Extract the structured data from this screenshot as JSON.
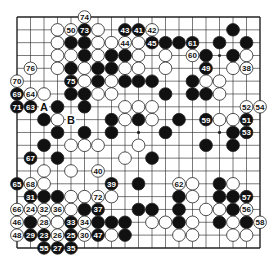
{
  "diagram": {
    "type": "go-board",
    "size": 19,
    "grid": {
      "x0": 17,
      "y0": 17,
      "dx": 13.5,
      "dy": 12.83
    },
    "colors": {
      "line": "#222222",
      "black_stone": "#111111",
      "white_stone": "#ffffff",
      "stone_outline": "#222222",
      "background": "#ffffff"
    },
    "star_points": [
      [
        3,
        3
      ],
      [
        3,
        9
      ],
      [
        3,
        15
      ],
      [
        9,
        3
      ],
      [
        9,
        9
      ],
      [
        9,
        15
      ],
      [
        15,
        3
      ],
      [
        15,
        9
      ],
      [
        15,
        15
      ]
    ],
    "stones": [
      {
        "r": 0,
        "c": 5,
        "color": "W",
        "label": "74"
      },
      {
        "r": 1,
        "c": 3,
        "color": "W"
      },
      {
        "r": 1,
        "c": 4,
        "color": "W",
        "label": "50"
      },
      {
        "r": 1,
        "c": 5,
        "color": "B",
        "label": "73"
      },
      {
        "r": 1,
        "c": 6,
        "color": "W"
      },
      {
        "r": 1,
        "c": 8,
        "color": "B",
        "label": "43"
      },
      {
        "r": 1,
        "c": 9,
        "color": "B",
        "label": "41"
      },
      {
        "r": 1,
        "c": 10,
        "color": "W",
        "label": "42"
      },
      {
        "r": 1,
        "c": 16,
        "color": "B"
      },
      {
        "r": 2,
        "c": 3,
        "color": "W"
      },
      {
        "r": 2,
        "c": 4,
        "color": "B"
      },
      {
        "r": 2,
        "c": 5,
        "color": "B"
      },
      {
        "r": 2,
        "c": 6,
        "color": "W"
      },
      {
        "r": 2,
        "c": 7,
        "color": "W"
      },
      {
        "r": 2,
        "c": 8,
        "color": "W",
        "label": "44"
      },
      {
        "r": 2,
        "c": 9,
        "color": "W"
      },
      {
        "r": 2,
        "c": 10,
        "color": "B",
        "label": "45"
      },
      {
        "r": 2,
        "c": 11,
        "color": "B"
      },
      {
        "r": 2,
        "c": 12,
        "color": "B"
      },
      {
        "r": 2,
        "c": 13,
        "color": "B",
        "label": "61"
      },
      {
        "r": 2,
        "c": 15,
        "color": "B"
      },
      {
        "r": 2,
        "c": 17,
        "color": "B"
      },
      {
        "r": 3,
        "c": 3,
        "color": "W"
      },
      {
        "r": 3,
        "c": 4,
        "color": "W"
      },
      {
        "r": 3,
        "c": 5,
        "color": "B"
      },
      {
        "r": 3,
        "c": 6,
        "color": "W"
      },
      {
        "r": 3,
        "c": 7,
        "color": "B"
      },
      {
        "r": 3,
        "c": 8,
        "color": "B"
      },
      {
        "r": 3,
        "c": 9,
        "color": "W"
      },
      {
        "r": 3,
        "c": 11,
        "color": "W"
      },
      {
        "r": 3,
        "c": 13,
        "color": "W",
        "label": "60"
      },
      {
        "r": 3,
        "c": 14,
        "color": "B"
      },
      {
        "r": 3,
        "c": 16,
        "color": "B"
      },
      {
        "r": 3,
        "c": 17,
        "color": "W"
      },
      {
        "r": 4,
        "c": 1,
        "color": "W",
        "label": "76"
      },
      {
        "r": 4,
        "c": 3,
        "color": "W"
      },
      {
        "r": 4,
        "c": 4,
        "color": "B"
      },
      {
        "r": 4,
        "c": 5,
        "color": "W"
      },
      {
        "r": 4,
        "c": 6,
        "color": "B"
      },
      {
        "r": 4,
        "c": 7,
        "color": "B"
      },
      {
        "r": 4,
        "c": 8,
        "color": "W"
      },
      {
        "r": 4,
        "c": 9,
        "color": "W"
      },
      {
        "r": 4,
        "c": 11,
        "color": "W"
      },
      {
        "r": 4,
        "c": 14,
        "color": "B",
        "label": "49"
      },
      {
        "r": 4,
        "c": 16,
        "color": "W"
      },
      {
        "r": 4,
        "c": 17,
        "color": "W",
        "label": "38"
      },
      {
        "r": 5,
        "c": 0,
        "color": "W",
        "label": "70"
      },
      {
        "r": 5,
        "c": 4,
        "color": "B",
        "label": "75"
      },
      {
        "r": 5,
        "c": 5,
        "color": "W"
      },
      {
        "r": 5,
        "c": 6,
        "color": "B"
      },
      {
        "r": 5,
        "c": 7,
        "color": "W"
      },
      {
        "r": 5,
        "c": 8,
        "color": "B"
      },
      {
        "r": 5,
        "c": 9,
        "color": "B"
      },
      {
        "r": 5,
        "c": 10,
        "color": "B"
      },
      {
        "r": 5,
        "c": 13,
        "color": "B"
      },
      {
        "r": 5,
        "c": 14,
        "color": "W"
      },
      {
        "r": 5,
        "c": 15,
        "color": "W"
      },
      {
        "r": 6,
        "c": 0,
        "color": "B",
        "label": "69"
      },
      {
        "r": 6,
        "c": 1,
        "color": "W",
        "label": "64"
      },
      {
        "r": 6,
        "c": 2,
        "color": "W"
      },
      {
        "r": 6,
        "c": 4,
        "color": "B"
      },
      {
        "r": 6,
        "c": 5,
        "color": "B"
      },
      {
        "r": 6,
        "c": 6,
        "color": "W"
      },
      {
        "r": 6,
        "c": 7,
        "color": "W"
      },
      {
        "r": 6,
        "c": 11,
        "color": "B"
      },
      {
        "r": 6,
        "c": 13,
        "color": "B"
      },
      {
        "r": 6,
        "c": 14,
        "color": "B"
      },
      {
        "r": 6,
        "c": 15,
        "color": "W"
      },
      {
        "r": 7,
        "c": 0,
        "color": "B",
        "label": "71"
      },
      {
        "r": 7,
        "c": 1,
        "color": "B",
        "label": "63"
      },
      {
        "r": 7,
        "c": 3,
        "color": "B"
      },
      {
        "r": 7,
        "c": 5,
        "color": "B"
      },
      {
        "r": 7,
        "c": 8,
        "color": "W"
      },
      {
        "r": 7,
        "c": 9,
        "color": "W"
      },
      {
        "r": 7,
        "c": 10,
        "color": "W"
      },
      {
        "r": 7,
        "c": 17,
        "color": "W",
        "label": "52"
      },
      {
        "r": 7,
        "c": 18,
        "color": "W",
        "label": "54"
      },
      {
        "r": 8,
        "c": 2,
        "color": "B"
      },
      {
        "r": 8,
        "c": 3,
        "color": "W"
      },
      {
        "r": 8,
        "c": 7,
        "color": "B"
      },
      {
        "r": 8,
        "c": 8,
        "color": "W"
      },
      {
        "r": 8,
        "c": 9,
        "color": "B"
      },
      {
        "r": 8,
        "c": 10,
        "color": "W"
      },
      {
        "r": 8,
        "c": 12,
        "color": "B"
      },
      {
        "r": 8,
        "c": 14,
        "color": "B",
        "label": "59"
      },
      {
        "r": 8,
        "c": 15,
        "color": "W"
      },
      {
        "r": 8,
        "c": 16,
        "color": "W"
      },
      {
        "r": 8,
        "c": 17,
        "color": "B",
        "label": "51"
      },
      {
        "r": 9,
        "c": 3,
        "color": "B"
      },
      {
        "r": 9,
        "c": 5,
        "color": "B"
      },
      {
        "r": 9,
        "c": 7,
        "color": "B"
      },
      {
        "r": 9,
        "c": 11,
        "color": "B"
      },
      {
        "r": 9,
        "c": 16,
        "color": "B"
      },
      {
        "r": 9,
        "c": 17,
        "color": "B",
        "label": "53"
      },
      {
        "r": 10,
        "c": 2,
        "color": "B"
      },
      {
        "r": 10,
        "c": 4,
        "color": "W"
      },
      {
        "r": 10,
        "c": 5,
        "color": "W"
      },
      {
        "r": 10,
        "c": 6,
        "color": "W"
      },
      {
        "r": 10,
        "c": 9,
        "color": "W"
      },
      {
        "r": 10,
        "c": 14,
        "color": "B"
      },
      {
        "r": 10,
        "c": 16,
        "color": "B"
      },
      {
        "r": 11,
        "c": 1,
        "color": "B",
        "label": "67"
      },
      {
        "r": 11,
        "c": 3,
        "color": "B"
      },
      {
        "r": 11,
        "c": 8,
        "color": "W"
      },
      {
        "r": 11,
        "c": 10,
        "color": "B"
      },
      {
        "r": 12,
        "c": 2,
        "color": "W"
      },
      {
        "r": 12,
        "c": 4,
        "color": "W"
      },
      {
        "r": 12,
        "c": 6,
        "color": "W",
        "label": "40"
      },
      {
        "r": 13,
        "c": 0,
        "color": "B",
        "label": "65"
      },
      {
        "r": 13,
        "c": 1,
        "color": "W",
        "label": "68"
      },
      {
        "r": 13,
        "c": 2,
        "color": "W"
      },
      {
        "r": 13,
        "c": 7,
        "color": "B",
        "label": "39"
      },
      {
        "r": 13,
        "c": 9,
        "color": "B"
      },
      {
        "r": 13,
        "c": 12,
        "color": "W",
        "label": "62"
      },
      {
        "r": 13,
        "c": 13,
        "color": "W"
      },
      {
        "r": 13,
        "c": 15,
        "color": "B"
      },
      {
        "r": 13,
        "c": 16,
        "color": "W"
      },
      {
        "r": 14,
        "c": 1,
        "color": "B",
        "label": "31"
      },
      {
        "r": 14,
        "c": 2,
        "color": "B"
      },
      {
        "r": 14,
        "c": 3,
        "color": "B"
      },
      {
        "r": 14,
        "c": 4,
        "color": "W"
      },
      {
        "r": 14,
        "c": 5,
        "color": "W"
      },
      {
        "r": 14,
        "c": 6,
        "color": "W",
        "label": "72"
      },
      {
        "r": 14,
        "c": 7,
        "color": "W"
      },
      {
        "r": 14,
        "c": 12,
        "color": "B"
      },
      {
        "r": 14,
        "c": 13,
        "color": "W"
      },
      {
        "r": 14,
        "c": 15,
        "color": "B"
      },
      {
        "r": 14,
        "c": 16,
        "color": "B"
      },
      {
        "r": 14,
        "c": 17,
        "color": "B",
        "label": "57"
      },
      {
        "r": 15,
        "c": 0,
        "color": "W",
        "label": "66"
      },
      {
        "r": 15,
        "c": 1,
        "color": "W",
        "label": "24"
      },
      {
        "r": 15,
        "c": 2,
        "color": "W",
        "label": "32"
      },
      {
        "r": 15,
        "c": 3,
        "color": "W",
        "label": "36"
      },
      {
        "r": 15,
        "c": 4,
        "color": "W"
      },
      {
        "r": 15,
        "c": 5,
        "color": "B"
      },
      {
        "r": 15,
        "c": 6,
        "color": "B",
        "label": "37"
      },
      {
        "r": 15,
        "c": 9,
        "color": "B"
      },
      {
        "r": 15,
        "c": 10,
        "color": "B"
      },
      {
        "r": 15,
        "c": 12,
        "color": "B"
      },
      {
        "r": 15,
        "c": 14,
        "color": "W"
      },
      {
        "r": 15,
        "c": 15,
        "color": "W"
      },
      {
        "r": 15,
        "c": 16,
        "color": "B"
      },
      {
        "r": 15,
        "c": 17,
        "color": "W",
        "label": "56"
      },
      {
        "r": 16,
        "c": 0,
        "color": "W",
        "label": "46"
      },
      {
        "r": 16,
        "c": 1,
        "color": "B"
      },
      {
        "r": 16,
        "c": 2,
        "color": "W",
        "label": "28"
      },
      {
        "r": 16,
        "c": 3,
        "color": "W"
      },
      {
        "r": 16,
        "c": 4,
        "color": "B",
        "label": "33"
      },
      {
        "r": 16,
        "c": 5,
        "color": "W",
        "label": "34"
      },
      {
        "r": 16,
        "c": 6,
        "color": "B"
      },
      {
        "r": 16,
        "c": 7,
        "color": "B"
      },
      {
        "r": 16,
        "c": 8,
        "color": "B"
      },
      {
        "r": 16,
        "c": 10,
        "color": "W"
      },
      {
        "r": 16,
        "c": 11,
        "color": "W"
      },
      {
        "r": 16,
        "c": 12,
        "color": "B"
      },
      {
        "r": 16,
        "c": 13,
        "color": "W"
      },
      {
        "r": 16,
        "c": 15,
        "color": "B"
      },
      {
        "r": 16,
        "c": 16,
        "color": "W"
      },
      {
        "r": 16,
        "c": 17,
        "color": "B"
      },
      {
        "r": 16,
        "c": 18,
        "color": "W",
        "label": "58"
      },
      {
        "r": 17,
        "c": 0,
        "color": "W",
        "label": "48"
      },
      {
        "r": 17,
        "c": 1,
        "color": "B",
        "label": "29"
      },
      {
        "r": 17,
        "c": 2,
        "color": "B",
        "label": "23"
      },
      {
        "r": 17,
        "c": 3,
        "color": "W",
        "label": "26"
      },
      {
        "r": 17,
        "c": 4,
        "color": "B",
        "label": "25"
      },
      {
        "r": 17,
        "c": 5,
        "color": "W",
        "label": "30"
      },
      {
        "r": 17,
        "c": 6,
        "color": "B",
        "label": "47"
      },
      {
        "r": 17,
        "c": 7,
        "color": "W"
      },
      {
        "r": 17,
        "c": 8,
        "color": "B"
      },
      {
        "r": 17,
        "c": 12,
        "color": "W"
      },
      {
        "r": 17,
        "c": 13,
        "color": "W"
      },
      {
        "r": 17,
        "c": 16,
        "color": "W"
      },
      {
        "r": 17,
        "c": 17,
        "color": "W"
      },
      {
        "r": 18,
        "c": 2,
        "color": "B",
        "label": "55"
      },
      {
        "r": 18,
        "c": 3,
        "color": "B",
        "label": "27"
      },
      {
        "r": 18,
        "c": 4,
        "color": "B",
        "label": "35"
      }
    ],
    "markers": [
      {
        "r": 7,
        "c": 2,
        "text": "A"
      },
      {
        "r": 8,
        "c": 4,
        "text": "B"
      }
    ]
  }
}
